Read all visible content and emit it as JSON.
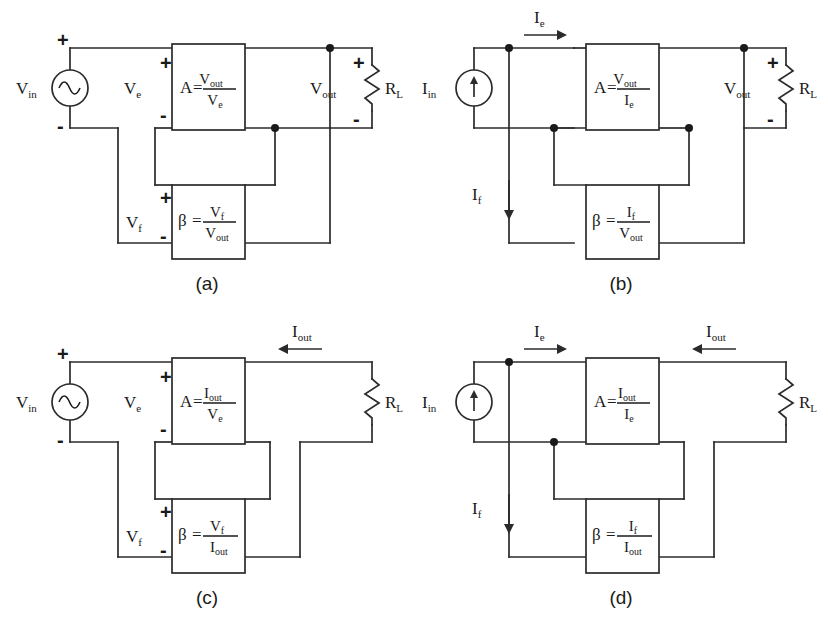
{
  "figure": {
    "line_color": "#2b2b2b",
    "text_color": "#1a1a1a",
    "background": "#ffffff"
  },
  "panels": [
    {
      "id": "a",
      "caption": "(a)",
      "source": {
        "label_base": "V",
        "label_sub": "in",
        "type": "ac-voltage-source",
        "plus": "+",
        "minus": "-"
      },
      "error": {
        "label_base": "V",
        "label_sub": "e",
        "plus": "+",
        "minus": "-"
      },
      "amp": {
        "symbol": "A",
        "equals": "=",
        "num_base": "V",
        "num_sub": "out",
        "den_base": "V",
        "den_sub": "e"
      },
      "feedback": {
        "symbol": "β",
        "equals": "=",
        "num_base": "V",
        "num_sub": "f",
        "den_base": "V",
        "den_sub": "out"
      },
      "fb_port": {
        "label_base": "V",
        "label_sub": "f",
        "plus": "+",
        "minus": "-"
      },
      "output": {
        "label_base": "V",
        "label_sub": "out",
        "plus": "+",
        "minus": "-"
      },
      "load": {
        "label_base": "R",
        "label_sub": "L"
      },
      "arrows": []
    },
    {
      "id": "b",
      "caption": "(b)",
      "source": {
        "label_base": "I",
        "label_sub": "in",
        "type": "dc-current-source"
      },
      "amp": {
        "symbol": "A",
        "equals": "=",
        "num_base": "V",
        "num_sub": "out",
        "den_base": "I",
        "den_sub": "e"
      },
      "feedback": {
        "symbol": "β",
        "equals": "=",
        "num_base": "I",
        "num_sub": "f",
        "den_base": "V",
        "den_sub": "out"
      },
      "output": {
        "label_base": "V",
        "label_sub": "out",
        "plus": "+",
        "minus": "-"
      },
      "load": {
        "label_base": "R",
        "label_sub": "L"
      },
      "arrows": [
        {
          "name": "ie",
          "label_base": "I",
          "label_sub": "e",
          "direction": "right"
        },
        {
          "name": "if",
          "label_base": "I",
          "label_sub": "f",
          "direction": "down"
        }
      ]
    },
    {
      "id": "c",
      "caption": "(c)",
      "source": {
        "label_base": "V",
        "label_sub": "in",
        "type": "ac-voltage-source",
        "plus": "+",
        "minus": "-"
      },
      "error": {
        "label_base": "V",
        "label_sub": "e",
        "plus": "+",
        "minus": "-"
      },
      "amp": {
        "symbol": "A",
        "equals": "=",
        "num_base": "I",
        "num_sub": "out",
        "den_base": "V",
        "den_sub": "e"
      },
      "feedback": {
        "symbol": "β",
        "equals": "=",
        "num_base": "V",
        "num_sub": "f",
        "den_base": "I",
        "den_sub": "out"
      },
      "fb_port": {
        "label_base": "V",
        "label_sub": "f",
        "plus": "+",
        "minus": "-"
      },
      "load": {
        "label_base": "R",
        "label_sub": "L"
      },
      "arrows": [
        {
          "name": "iout",
          "label_base": "I",
          "label_sub": "out",
          "direction": "left"
        }
      ]
    },
    {
      "id": "d",
      "caption": "(d)",
      "source": {
        "label_base": "I",
        "label_sub": "in",
        "type": "dc-current-source"
      },
      "amp": {
        "symbol": "A",
        "equals": "=",
        "num_base": "I",
        "num_sub": "out",
        "den_base": "I",
        "den_sub": "e"
      },
      "feedback": {
        "symbol": "β",
        "equals": "=",
        "num_base": "I",
        "num_sub": "f",
        "den_base": "I",
        "den_sub": "out"
      },
      "load": {
        "label_base": "R",
        "label_sub": "L"
      },
      "arrows": [
        {
          "name": "ie",
          "label_base": "I",
          "label_sub": "e",
          "direction": "right"
        },
        {
          "name": "iout",
          "label_base": "I",
          "label_sub": "out",
          "direction": "left"
        },
        {
          "name": "if",
          "label_base": "I",
          "label_sub": "f",
          "direction": "down"
        }
      ]
    }
  ]
}
